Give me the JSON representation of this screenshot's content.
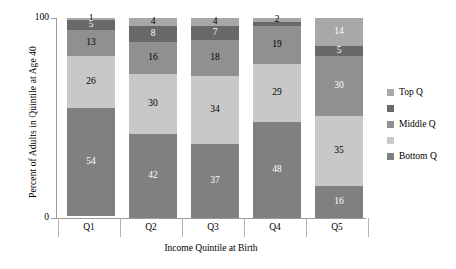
{
  "chart_data": {
    "type": "bar",
    "title": "",
    "xlabel": "Income Quintile at Birth",
    "ylabel": "Percent of Adults in Quintile at Age 40",
    "ylim": [
      0,
      100
    ],
    "yticks": [
      "0",
      "100"
    ],
    "grid": false,
    "stacked": true,
    "legend_position": "right",
    "categories": [
      "Q1",
      "Q2",
      "Q3",
      "Q4",
      "Q5"
    ],
    "series": [
      {
        "name": "Bottom Q",
        "values": [
          54,
          42,
          37,
          48,
          16
        ],
        "color": "#808080"
      },
      {
        "name": "",
        "values": [
          26,
          30,
          34,
          29,
          35
        ],
        "color": "#c8c8c8"
      },
      {
        "name": "Middle Q",
        "values": [
          13,
          16,
          18,
          19,
          30
        ],
        "color": "#909090"
      },
      {
        "name": "",
        "values": [
          5,
          8,
          7,
          2,
          5
        ],
        "color": "#696969"
      },
      {
        "name": "Top Q",
        "values": [
          1,
          4,
          4,
          2,
          14
        ],
        "color": "#a8a8a8"
      }
    ],
    "legend_entries": [
      {
        "label": "Top Q",
        "color": "#a8a8a8"
      },
      {
        "label": "",
        "color": "#696969"
      },
      {
        "label": "Middle Q",
        "color": "#909090"
      },
      {
        "label": "",
        "color": "#c8c8c8"
      },
      {
        "label": "Bottom Q",
        "color": "#808080"
      }
    ],
    "bars": [
      {
        "category": "Q1",
        "segments": [
          {
            "series": "Top Q",
            "value": 1,
            "label": "1",
            "color": "#a8a8a8",
            "text_color": "#000000"
          },
          {
            "series": "",
            "value": 5,
            "label": "5",
            "color": "#696969",
            "text_color": "#ffffff"
          },
          {
            "series": "Middle Q",
            "value": 13,
            "label": "13",
            "color": "#909090",
            "text_color": "#000000"
          },
          {
            "series": "",
            "value": 26,
            "label": "26",
            "color": "#c8c8c8",
            "text_color": "#000000"
          },
          {
            "series": "Bottom Q",
            "value": 54,
            "label": "54",
            "color": "#808080",
            "text_color": "#ffffff"
          }
        ]
      },
      {
        "category": "Q2",
        "segments": [
          {
            "series": "Top Q",
            "value": 4,
            "label": "4",
            "color": "#a8a8a8",
            "text_color": "#000000"
          },
          {
            "series": "",
            "value": 8,
            "label": "8",
            "color": "#696969",
            "text_color": "#ffffff"
          },
          {
            "series": "Middle Q",
            "value": 16,
            "label": "16",
            "color": "#909090",
            "text_color": "#000000"
          },
          {
            "series": "",
            "value": 30,
            "label": "30",
            "color": "#c8c8c8",
            "text_color": "#000000"
          },
          {
            "series": "Bottom Q",
            "value": 42,
            "label": "42",
            "color": "#808080",
            "text_color": "#ffffff"
          }
        ]
      },
      {
        "category": "Q3",
        "segments": [
          {
            "series": "Top Q",
            "value": 4,
            "label": "4",
            "color": "#a8a8a8",
            "text_color": "#000000"
          },
          {
            "series": "",
            "value": 7,
            "label": "7",
            "color": "#696969",
            "text_color": "#ffffff"
          },
          {
            "series": "Middle Q",
            "value": 18,
            "label": "18",
            "color": "#909090",
            "text_color": "#000000"
          },
          {
            "series": "",
            "value": 34,
            "label": "34",
            "color": "#c8c8c8",
            "text_color": "#000000"
          },
          {
            "series": "Bottom Q",
            "value": 37,
            "label": "37",
            "color": "#808080",
            "text_color": "#ffffff"
          }
        ]
      },
      {
        "category": "Q4",
        "segments": [
          {
            "series": "Top Q",
            "value": 2,
            "label": "2",
            "color": "#a8a8a8",
            "text_color": "#000000"
          },
          {
            "series": "",
            "value": 2,
            "label": "",
            "color": "#696969",
            "text_color": "#ffffff"
          },
          {
            "series": "Middle Q",
            "value": 19,
            "label": "19",
            "color": "#909090",
            "text_color": "#000000"
          },
          {
            "series": "",
            "value": 29,
            "label": "29",
            "color": "#c8c8c8",
            "text_color": "#000000"
          },
          {
            "series": "Bottom Q",
            "value": 48,
            "label": "48",
            "color": "#808080",
            "text_color": "#ffffff"
          }
        ]
      },
      {
        "category": "Q5",
        "segments": [
          {
            "series": "Top Q",
            "value": 14,
            "label": "14",
            "color": "#a8a8a8",
            "text_color": "#ffffff"
          },
          {
            "series": "",
            "value": 5,
            "label": "5",
            "color": "#696969",
            "text_color": "#ffffff"
          },
          {
            "series": "Middle Q",
            "value": 30,
            "label": "30",
            "color": "#909090",
            "text_color": "#ffffff"
          },
          {
            "series": "",
            "value": 35,
            "label": "35",
            "color": "#c8c8c8",
            "text_color": "#000000"
          },
          {
            "series": "Bottom Q",
            "value": 16,
            "label": "16",
            "color": "#808080",
            "text_color": "#ffffff"
          }
        ]
      }
    ]
  },
  "axis": {
    "y_title": "Percent of Adults in Quintile at Age 40",
    "x_title": "Income Quintile at Birth",
    "y_tick_top": "100",
    "y_tick_bottom": "0"
  }
}
